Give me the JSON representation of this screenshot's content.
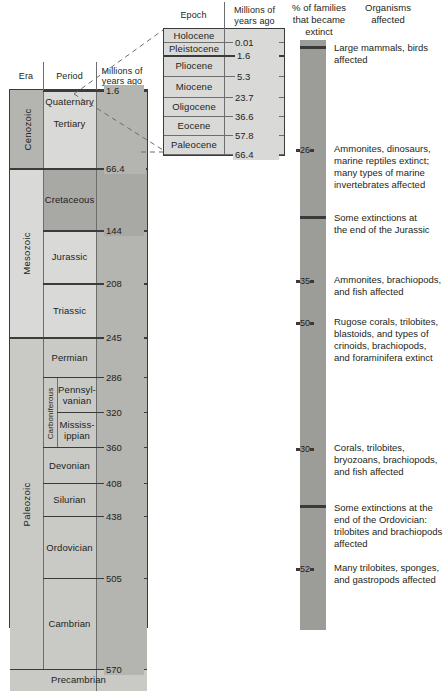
{
  "era_table": {
    "headers": {
      "era": "Era",
      "period": "Period",
      "ma": "Millions of\nyears ago"
    },
    "eras": [
      {
        "name": "Cenozoic"
      },
      {
        "name": "Mesozoic"
      },
      {
        "name": "Paleozoic"
      }
    ],
    "periods": [
      {
        "name": "Quaternary"
      },
      {
        "name": "Tertiary"
      },
      {
        "name": "Cretaceous"
      },
      {
        "name": "Jurassic"
      },
      {
        "name": "Triassic"
      },
      {
        "name": "Permian"
      },
      {
        "name": "Pennsyl-\nvanian"
      },
      {
        "name": "Mississ-\nippian"
      },
      {
        "name": "Devonian"
      },
      {
        "name": "Silurian"
      },
      {
        "name": "Ordovician"
      },
      {
        "name": "Cambrian"
      }
    ],
    "subgroup": {
      "name": "Carboniferous"
    },
    "basement": {
      "name": "Precambrian"
    },
    "boundaries": [
      "1.6",
      "66.4",
      "144",
      "208",
      "245",
      "286",
      "320",
      "360",
      "408",
      "438",
      "505",
      "570"
    ]
  },
  "epoch_table": {
    "headers": {
      "epoch": "Epoch",
      "ma": "Millions of\nyears ago"
    },
    "epochs": [
      {
        "name": "Holocene"
      },
      {
        "name": "Pleistocene"
      },
      {
        "name": "Pliocene"
      },
      {
        "name": "Miocene"
      },
      {
        "name": "Oligocene"
      },
      {
        "name": "Eocene"
      },
      {
        "name": "Paleocene"
      }
    ],
    "boundaries": [
      "0.01",
      "1.6",
      "5.3",
      "23.7",
      "36.6",
      "57.8",
      "66.4"
    ]
  },
  "extinction": {
    "headers": {
      "percent": "% of families\nthat became\nextinct",
      "organisms": "Organisms\naffected"
    },
    "events": [
      {
        "percent": "",
        "organisms": "Large mammals, birds\naffected"
      },
      {
        "percent": "26",
        "organisms": "Ammonites, dinosaurs,\nmarine reptiles extinct;\nmany types of marine\ninvertebrates affected"
      },
      {
        "percent": "",
        "organisms": "Some extinctions at\nthe end of the Jurassic"
      },
      {
        "percent": "35",
        "organisms": "Ammonites, brachiopods,\nand fish affected"
      },
      {
        "percent": "50",
        "organisms": "Rugose corals, trilobites,\nblastoids, and types of\ncrinoids, brachiopods,\nand foraminifera extinct"
      },
      {
        "percent": "30",
        "organisms": "Corals, trilobites,\nbryozoans, brachiopods,\nand fish affected"
      },
      {
        "percent": "",
        "organisms": "Some extinctions at the\nend of the Ordovician:\ntrilobites and brachiopods\naffected"
      },
      {
        "percent": "52",
        "organisms": "Many trilobites, sponges,\nand gastropods affected"
      }
    ]
  },
  "colors": {
    "bar": "#9c9c99",
    "band": "#3a3a3a",
    "rule": "#3b3b3b",
    "text": "#231f20",
    "tone_light": "#d9d9d7",
    "tone_mid": "#c9c9c6",
    "tone_dark": "#b4b4b1",
    "tone_darker": "#a8a8a5"
  }
}
